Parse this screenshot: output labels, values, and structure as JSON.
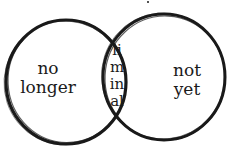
{
  "diagram": {
    "type": "venn",
    "left_circle": {
      "label_lines": [
        "no",
        "longer"
      ]
    },
    "right_circle": {
      "label_lines": [
        "not",
        "yet"
      ]
    },
    "intersection": {
      "label_lines": [
        "li",
        "m",
        "in",
        "al"
      ]
    },
    "stroke_color": "#1a1a1a",
    "background": "#ffffff"
  }
}
